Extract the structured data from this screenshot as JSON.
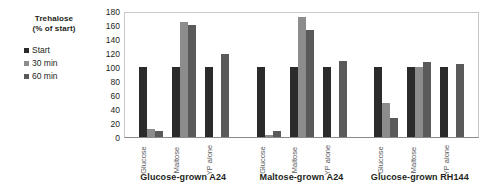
{
  "legend": {
    "title_line1": "Trehalose",
    "title_line2": "(% of start)",
    "entries": [
      {
        "label": "Start",
        "color": "#2b2b2b"
      },
      {
        "label": "30 min",
        "color": "#8c8c8c"
      },
      {
        "label": "60 min",
        "color": "#5a5a5a"
      }
    ]
  },
  "chart_data": {
    "type": "bar",
    "title": "",
    "xlabel": "",
    "ylabel": "Trehalose (% of start)",
    "ylim": [
      0,
      180
    ],
    "yticks": [
      180,
      160,
      140,
      120,
      100,
      80,
      60,
      40,
      20,
      0
    ],
    "grid": false,
    "legend_position": "left",
    "groups": [
      "Glucose-grown A24",
      "Maltose-grown A24",
      "Glucose-grown RH144"
    ],
    "categories": [
      "Glucose",
      "Maltose",
      "YP alone"
    ],
    "series": [
      {
        "name": "Start",
        "color": "#2b2b2b",
        "values": [
          [
            100,
            100,
            100
          ],
          [
            100,
            100,
            100
          ],
          [
            100,
            100,
            100
          ]
        ]
      },
      {
        "name": "30 min",
        "color": "#8c8c8c",
        "values": [
          [
            12,
            165,
            0
          ],
          [
            3,
            172,
            0
          ],
          [
            48,
            100,
            0
          ]
        ]
      },
      {
        "name": "60 min",
        "color": "#5a5a5a",
        "values": [
          [
            8,
            160,
            118
          ],
          [
            8,
            153,
            108
          ],
          [
            27,
            107,
            105
          ]
        ]
      }
    ]
  }
}
